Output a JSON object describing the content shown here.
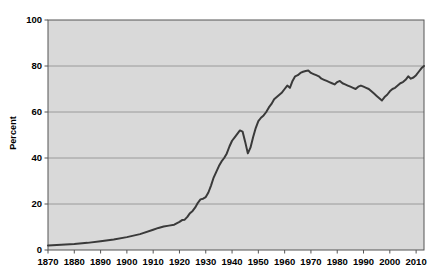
{
  "chart_data": {
    "type": "line",
    "title": "",
    "xlabel": "",
    "ylabel": "Percent",
    "xlim": [
      1870,
      2013
    ],
    "ylim": [
      0,
      100
    ],
    "grid": true,
    "legend": "none",
    "y_ticks": [
      0,
      20,
      40,
      60,
      80,
      100
    ],
    "x_ticks": [
      1870,
      1880,
      1890,
      1900,
      1910,
      1920,
      1930,
      1940,
      1950,
      1960,
      1970,
      1980,
      1990,
      2000,
      2010
    ],
    "x_tick_labels": [
      "1870",
      "1880",
      "1890",
      "1900",
      "1910",
      "1920",
      "1930",
      "1940",
      "1950",
      "1960",
      "1970",
      "1980",
      "1990",
      "2000",
      "2010"
    ],
    "y_tick_labels": [
      "0",
      "20",
      "40",
      "60",
      "80",
      "100"
    ],
    "series": [
      {
        "name": "Percent",
        "color": "#3a3a3a",
        "x": [
          1870,
          1875,
          1880,
          1885,
          1890,
          1895,
          1900,
          1905,
          1910,
          1912,
          1914,
          1916,
          1918,
          1920,
          1921,
          1922,
          1923,
          1924,
          1925,
          1926,
          1927,
          1928,
          1929,
          1930,
          1931,
          1932,
          1933,
          1934,
          1935,
          1936,
          1937,
          1938,
          1939,
          1940,
          1941,
          1942,
          1943,
          1944,
          1945,
          1946,
          1947,
          1948,
          1949,
          1950,
          1951,
          1952,
          1953,
          1954,
          1955,
          1956,
          1957,
          1958,
          1959,
          1960,
          1961,
          1962,
          1963,
          1964,
          1965,
          1966,
          1967,
          1968,
          1969,
          1970,
          1971,
          1972,
          1973,
          1974,
          1975,
          1976,
          1977,
          1978,
          1979,
          1980,
          1981,
          1982,
          1983,
          1984,
          1985,
          1986,
          1987,
          1988,
          1989,
          1990,
          1991,
          1992,
          1993,
          1994,
          1995,
          1996,
          1997,
          1998,
          1999,
          2000,
          2001,
          2002,
          2003,
          2004,
          2005,
          2006,
          2007,
          2008,
          2009,
          2010,
          2011,
          2012,
          2013
        ],
        "y": [
          2.0,
          2.3,
          2.6,
          3.1,
          3.8,
          4.6,
          5.6,
          6.9,
          8.8,
          9.6,
          10.2,
          10.6,
          11.0,
          12.2,
          13.0,
          13.2,
          14.4,
          16.0,
          17.0,
          18.5,
          20.5,
          22.0,
          22.3,
          23.0,
          25.0,
          28.0,
          31.5,
          34.0,
          36.5,
          38.5,
          40.0,
          42.0,
          45.0,
          47.5,
          49.0,
          50.5,
          52.0,
          51.5,
          47.0,
          42.0,
          44.5,
          49.0,
          53.0,
          56.0,
          57.5,
          58.5,
          60.0,
          62.0,
          63.5,
          65.5,
          66.5,
          67.5,
          68.5,
          70.0,
          71.5,
          70.5,
          73.5,
          75.5,
          76.0,
          77.0,
          77.5,
          77.8,
          78.0,
          77.0,
          76.5,
          76.0,
          75.5,
          74.5,
          74.0,
          73.5,
          73.0,
          72.5,
          72.0,
          73.0,
          73.5,
          72.5,
          72.0,
          71.5,
          71.0,
          70.5,
          70.0,
          71.0,
          71.5,
          71.0,
          70.5,
          70.0,
          69.0,
          68.0,
          67.0,
          66.0,
          65.0,
          66.5,
          67.5,
          69.0,
          70.0,
          70.5,
          71.5,
          72.5,
          73.0,
          74.0,
          75.5,
          74.5,
          75.0,
          76.0,
          77.5,
          79.0,
          80.0
        ]
      }
    ]
  },
  "plot": {
    "background_color": "#d9d9d9",
    "gridline_color": "#9a9a9a",
    "border_color": "#555555",
    "line_color": "#3a3a3a"
  }
}
